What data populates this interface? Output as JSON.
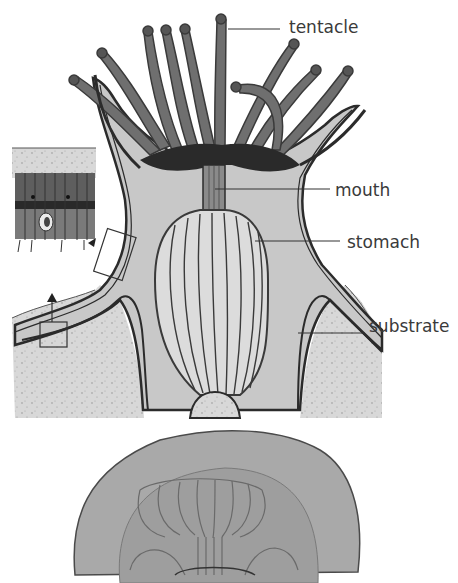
{
  "diagram": {
    "colors": {
      "background": "#ffffff",
      "body_fill": "#c9c9c9",
      "outline": "#2b2b2b",
      "tentacle": "#6f6f6f",
      "oral_disc": "#2a2a2a",
      "substrate": "#d6d6d6",
      "inset_cells": "#6a6a6a",
      "label_text": "#3a3a3a"
    },
    "labels": [
      {
        "id": "tentacle",
        "text": "tentacle",
        "x": 289,
        "y": 19
      },
      {
        "id": "mouth",
        "text": "mouth",
        "x": 335,
        "y": 182
      },
      {
        "id": "stomach",
        "text": "stomach",
        "x": 347,
        "y": 234
      },
      {
        "id": "substrate",
        "text": "substrate",
        "x": 369,
        "y": 318
      }
    ],
    "insets": [
      {
        "id": "tissue-detail",
        "description": "magnified cell layer inset"
      },
      {
        "id": "skeleton-detail",
        "description": "arrow pointing up from box at base"
      }
    ],
    "lower_figure": {
      "description": "top-down translucent medusa/polyp view"
    }
  }
}
